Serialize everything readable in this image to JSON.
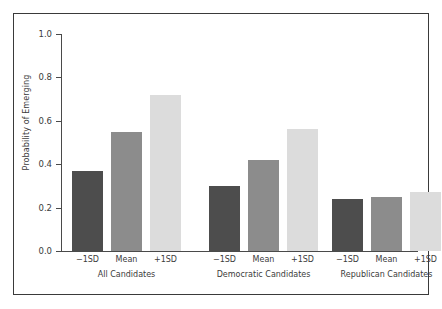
{
  "chart_data": {
    "type": "bar",
    "title": "",
    "subtitle": "",
    "xlabel": "",
    "ylabel": "Probability of Emerging",
    "ylim": [
      0.0,
      1.0
    ],
    "yticks": [
      "0.0",
      "0.2",
      "0.4",
      "0.6",
      "0.8",
      "1.0"
    ],
    "ytick_values": [
      0.0,
      0.2,
      0.4,
      0.6,
      0.8,
      1.0
    ],
    "grid": false,
    "legend": "none",
    "categories": [
      "−1SD",
      "Mean",
      "+1SD"
    ],
    "groups": [
      {
        "label": "All Candidates",
        "bars": [
          {
            "category": "−1SD",
            "value": 0.37,
            "color": "#4d4d4d"
          },
          {
            "category": "Mean",
            "value": 0.55,
            "color": "#8c8c8c"
          },
          {
            "category": "+1SD",
            "value": 0.72,
            "color": "#dcdcdc"
          }
        ]
      },
      {
        "label": "Democratic Candidates",
        "bars": [
          {
            "category": "−1SD",
            "value": 0.3,
            "color": "#4d4d4d"
          },
          {
            "category": "Mean",
            "value": 0.42,
            "color": "#8c8c8c"
          },
          {
            "category": "+1SD",
            "value": 0.56,
            "color": "#dcdcdc"
          }
        ]
      },
      {
        "label": "Republican Candidates",
        "bars": [
          {
            "category": "−1SD",
            "value": 0.24,
            "color": "#4d4d4d"
          },
          {
            "category": "Mean",
            "value": 0.25,
            "color": "#8c8c8c"
          },
          {
            "category": "+1SD",
            "value": 0.27,
            "color": "#dcdcdc"
          }
        ]
      }
    ],
    "series": [
      {
        "name": "−1SD",
        "values": [
          0.37,
          0.3,
          0.24
        ],
        "color": "#4d4d4d"
      },
      {
        "name": "Mean",
        "values": [
          0.55,
          0.42,
          0.25
        ],
        "color": "#8c8c8c"
      },
      {
        "name": "+1SD",
        "values": [
          0.72,
          0.56,
          0.27
        ],
        "color": "#dcdcdc"
      }
    ],
    "colors": {
      "bar_dark": "#4d4d4d",
      "bar_medium": "#8c8c8c",
      "bar_light": "#dcdcdc",
      "axis": "#4a4a4a",
      "frame": "#3a3a3a",
      "text": "#3b3b3b",
      "background": "#ffffff"
    }
  }
}
